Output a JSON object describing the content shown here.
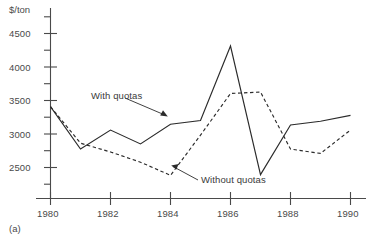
{
  "figure": {
    "caption": "(a)",
    "y_axis_unit": "$/ton"
  },
  "chart_data": {
    "type": "line",
    "title": "",
    "subtitle": "",
    "xlabel": "",
    "ylabel": "$/ton",
    "x": [
      1980,
      1981,
      1982,
      1983,
      1984,
      1985,
      1986,
      1987,
      1988,
      1989,
      1990
    ],
    "xlim": [
      1980,
      1990
    ],
    "ylim": [
      2150,
      4750
    ],
    "xticks": [
      1980,
      1982,
      1984,
      1986,
      1988,
      1990
    ],
    "xtick_labels": [
      "1980",
      "1982",
      "1984",
      "1986",
      "1988",
      "1990"
    ],
    "yticks": [
      2500,
      3000,
      3500,
      4000,
      4500
    ],
    "ytick_labels": [
      "2500",
      "3000",
      "3500",
      "4000",
      "4500"
    ],
    "y_minor_ticks": [
      2250,
      2750,
      3250,
      3750,
      4250,
      4600
    ],
    "grid": false,
    "legend_position": "inline-annotations",
    "series": [
      {
        "name": "With quotas",
        "style": "solid",
        "color": "#2b2b2b",
        "values": [
          3400,
          2820,
          3080,
          2890,
          3160,
          3210,
          4230,
          2470,
          3150,
          3200,
          3280
        ]
      },
      {
        "name": "Without quotas",
        "style": "dashed",
        "color": "#2b2b2b",
        "values": [
          3400,
          2900,
          2780,
          2640,
          2460,
          3010,
          3580,
          3600,
          2820,
          2760,
          3080
        ]
      }
    ],
    "annotations": [
      {
        "text": "With quotas",
        "target_series": "With quotas",
        "target_x": 1984,
        "target_y": 3160
      },
      {
        "text": "Without quotas",
        "target_series": "Without quotas",
        "target_x": 1984.2,
        "target_y": 2470
      }
    ]
  }
}
